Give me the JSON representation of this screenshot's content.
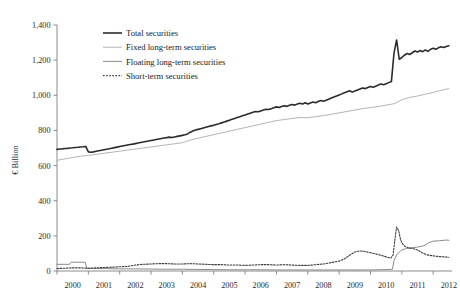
{
  "chart_data": {
    "type": "line",
    "title": "",
    "xlabel": "",
    "ylabel": "€ Billion",
    "ylim": [
      0,
      1400
    ],
    "ytick_labels": [
      "0",
      "200",
      "400",
      "600",
      "800",
      "1,000",
      "1,200",
      "1,400"
    ],
    "ytick_values": [
      0,
      200,
      400,
      600,
      800,
      1000,
      1200,
      1400
    ],
    "xtick_labels": [
      "2000",
      "2001",
      "2002",
      "2003",
      "2004",
      "2005",
      "2006",
      "2007",
      "2008",
      "2009",
      "2010",
      "2011",
      "2012"
    ],
    "xlim": [
      2000.0,
      2012.6
    ],
    "grid": false,
    "legend_position": "top-left-inside",
    "colors": {
      "total": "#2b2b2b",
      "fixed": "#b4b4b4",
      "floating": "#8a8a8a",
      "short": "#3a3a3a",
      "axis": "#808080",
      "text": "#1a1a1a"
    },
    "series": [
      {
        "name": "Total securities",
        "style": "solid",
        "width": 1.6,
        "color": "#2b2b2b",
        "x": [
          2000.0,
          2000.083,
          2000.167,
          2000.25,
          2000.333,
          2000.417,
          2000.5,
          2000.583,
          2000.667,
          2000.75,
          2000.833,
          2000.917,
          2001.0,
          2001.083,
          2001.167,
          2001.25,
          2001.333,
          2001.417,
          2001.5,
          2001.583,
          2001.667,
          2001.75,
          2001.833,
          2001.917,
          2002.0,
          2002.083,
          2002.167,
          2002.25,
          2002.333,
          2002.417,
          2002.5,
          2002.583,
          2002.667,
          2002.75,
          2002.833,
          2002.917,
          2003.0,
          2003.083,
          2003.167,
          2003.25,
          2003.333,
          2003.417,
          2003.5,
          2003.583,
          2003.667,
          2003.75,
          2003.833,
          2003.917,
          2004.0,
          2004.083,
          2004.167,
          2004.25,
          2004.333,
          2004.417,
          2004.5,
          2004.583,
          2004.667,
          2004.75,
          2004.833,
          2004.917,
          2005.0,
          2005.083,
          2005.167,
          2005.25,
          2005.333,
          2005.417,
          2005.5,
          2005.583,
          2005.667,
          2005.75,
          2005.833,
          2005.917,
          2006.0,
          2006.083,
          2006.167,
          2006.25,
          2006.333,
          2006.417,
          2006.5,
          2006.583,
          2006.667,
          2006.75,
          2006.833,
          2006.917,
          2007.0,
          2007.083,
          2007.167,
          2007.25,
          2007.333,
          2007.417,
          2007.5,
          2007.583,
          2007.667,
          2007.75,
          2007.833,
          2007.917,
          2008.0,
          2008.083,
          2008.167,
          2008.25,
          2008.333,
          2008.417,
          2008.5,
          2008.583,
          2008.667,
          2008.75,
          2008.833,
          2008.917,
          2009.0,
          2009.083,
          2009.167,
          2009.25,
          2009.333,
          2009.417,
          2009.5,
          2009.583,
          2009.667,
          2009.75,
          2009.833,
          2009.917,
          2010.0,
          2010.083,
          2010.167,
          2010.25,
          2010.333,
          2010.417,
          2010.5,
          2010.583,
          2010.667,
          2010.75,
          2010.833,
          2010.917,
          2011.0,
          2011.083,
          2011.167,
          2011.25,
          2011.333,
          2011.417,
          2011.5,
          2011.583,
          2011.667,
          2011.75,
          2011.833,
          2011.917,
          2012.0,
          2012.083,
          2012.167,
          2012.25,
          2012.333,
          2012.417,
          2012.5
        ],
        "values": [
          692,
          694,
          695,
          697,
          698,
          700,
          701,
          703,
          704,
          706,
          707,
          709,
          678,
          676,
          678,
          681,
          684,
          687,
          690,
          693,
          696,
          699,
          702,
          705,
          708,
          711,
          714,
          717,
          720,
          722,
          725,
          728,
          731,
          734,
          737,
          740,
          743,
          745,
          748,
          751,
          754,
          757,
          759,
          762,
          760,
          763,
          766,
          769,
          772,
          775,
          780,
          790,
          797,
          802,
          806,
          810,
          814,
          818,
          822,
          826,
          830,
          834,
          838,
          843,
          848,
          853,
          858,
          863,
          868,
          873,
          878,
          883,
          888,
          893,
          898,
          903,
          908,
          906,
          911,
          916,
          921,
          919,
          924,
          929,
          934,
          930,
          936,
          941,
          937,
          943,
          948,
          944,
          950,
          955,
          951,
          957,
          950,
          956,
          962,
          958,
          964,
          970,
          966,
          972,
          978,
          984,
          990,
          996,
          1002,
          1008,
          1014,
          1020,
          1026,
          1018,
          1024,
          1030,
          1036,
          1042,
          1038,
          1044,
          1050,
          1046,
          1052,
          1058,
          1064,
          1060,
          1066,
          1072,
          1078,
          1240,
          1315,
          1205,
          1215,
          1228,
          1238,
          1232,
          1242,
          1252,
          1246,
          1255,
          1248,
          1258,
          1250,
          1262,
          1268,
          1262,
          1270,
          1276,
          1272,
          1278,
          1282
        ]
      },
      {
        "name": "Fixed long-term securities",
        "style": "solid",
        "width": 1.0,
        "color": "#b4b4b4",
        "x": [
          2000.0,
          2000.25,
          2000.5,
          2000.75,
          2001.0,
          2001.25,
          2001.5,
          2001.75,
          2002.0,
          2002.25,
          2002.5,
          2002.75,
          2003.0,
          2003.25,
          2003.5,
          2003.75,
          2004.0,
          2004.25,
          2004.5,
          2004.75,
          2005.0,
          2005.25,
          2005.5,
          2005.75,
          2006.0,
          2006.25,
          2006.5,
          2006.75,
          2007.0,
          2007.25,
          2007.5,
          2007.75,
          2008.0,
          2008.25,
          2008.5,
          2008.75,
          2009.0,
          2009.25,
          2009.5,
          2009.75,
          2010.0,
          2010.25,
          2010.5,
          2010.75,
          2011.0,
          2011.25,
          2011.5,
          2011.75,
          2012.0,
          2012.25,
          2012.5
        ],
        "values": [
          630,
          638,
          646,
          653,
          658,
          664,
          670,
          676,
          682,
          688,
          694,
          700,
          706,
          712,
          718,
          724,
          730,
          745,
          756,
          766,
          776,
          786,
          796,
          806,
          816,
          826,
          836,
          846,
          856,
          862,
          868,
          874,
          872,
          878,
          884,
          892,
          900,
          908,
          916,
          924,
          930,
          936,
          944,
          952,
          975,
          988,
          996,
          1006,
          1016,
          1028,
          1038
        ]
      },
      {
        "name": "Floating long-term securities",
        "style": "solid",
        "width": 1.0,
        "color": "#8a8a8a",
        "x": [
          2000.0,
          2000.4,
          2000.45,
          2000.9,
          2000.95,
          2001.0,
          2001.5,
          2002.0,
          2002.5,
          2003.0,
          2003.5,
          2004.0,
          2004.5,
          2005.0,
          2005.5,
          2006.0,
          2006.5,
          2007.0,
          2007.5,
          2008.0,
          2008.5,
          2009.0,
          2009.5,
          2010.0,
          2010.5,
          2010.7,
          2010.75,
          2010.85,
          2010.95,
          2011.0,
          2011.15,
          2011.3,
          2011.5,
          2011.7,
          2011.85,
          2012.0,
          2012.2,
          2012.4,
          2012.5
        ],
        "values": [
          38,
          38,
          50,
          50,
          14,
          14,
          14,
          12,
          12,
          11,
          10,
          10,
          9,
          8,
          7,
          7,
          7,
          6,
          6,
          6,
          6,
          6,
          6,
          6,
          8,
          10,
          60,
          95,
          112,
          120,
          128,
          132,
          136,
          144,
          160,
          170,
          172,
          176,
          175
        ]
      },
      {
        "name": "Short-term securities",
        "style": "dotted",
        "width": 1.1,
        "color": "#3a3a3a",
        "x": [
          2000.0,
          2000.25,
          2000.5,
          2000.75,
          2001.0,
          2001.25,
          2001.5,
          2001.75,
          2002.0,
          2002.25,
          2002.5,
          2002.75,
          2003.0,
          2003.25,
          2003.5,
          2003.75,
          2004.0,
          2004.25,
          2004.5,
          2004.75,
          2005.0,
          2005.25,
          2005.5,
          2005.75,
          2006.0,
          2006.25,
          2006.5,
          2006.75,
          2007.0,
          2007.25,
          2007.5,
          2007.75,
          2008.0,
          2008.25,
          2008.5,
          2008.75,
          2009.0,
          2009.2,
          2009.35,
          2009.5,
          2009.65,
          2009.8,
          2010.0,
          2010.2,
          2010.4,
          2010.55,
          2010.65,
          2010.72,
          2010.78,
          2010.83,
          2010.9,
          2010.95,
          2011.0,
          2011.1,
          2011.2,
          2011.35,
          2011.5,
          2011.65,
          2011.8,
          2012.0,
          2012.2,
          2012.4,
          2012.5
        ],
        "values": [
          14,
          16,
          18,
          18,
          16,
          18,
          20,
          22,
          24,
          26,
          34,
          38,
          40,
          42,
          42,
          40,
          40,
          42,
          40,
          38,
          36,
          36,
          34,
          34,
          32,
          34,
          36,
          36,
          34,
          36,
          34,
          32,
          32,
          36,
          40,
          48,
          56,
          72,
          92,
          108,
          114,
          112,
          104,
          96,
          86,
          78,
          74,
          90,
          180,
          250,
          230,
          185,
          160,
          140,
          132,
          128,
          120,
          104,
          92,
          86,
          82,
          80,
          78
        ]
      }
    ]
  },
  "legend": {
    "items": [
      {
        "label": "Total securities",
        "swatch": "solid-thick-dark"
      },
      {
        "label": "Fixed long-term securities",
        "swatch": "solid-light-gray"
      },
      {
        "label": "Floating long-term securities",
        "swatch": "solid-gray"
      },
      {
        "label": "Short-term securities",
        "swatch": "dotted-dark"
      }
    ]
  }
}
